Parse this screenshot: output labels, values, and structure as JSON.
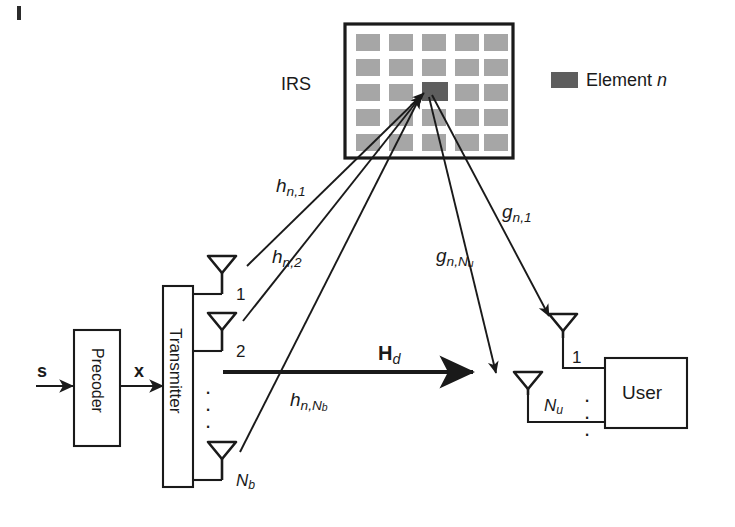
{
  "figure": {
    "width": 735,
    "height": 527,
    "background": "#ffffff",
    "line_color": "#1a1a1a"
  },
  "colors": {
    "element_normal": "#a6a6a6",
    "element_highlight": "#5e5e5e",
    "panel_border": "#1a1a1a",
    "box_border": "#1a1a1a",
    "text": "#1a1a1a",
    "arrow": "#1a1a1a"
  },
  "irs": {
    "label": "IRS",
    "rows": 5,
    "cols": 5,
    "highlight_row": 3,
    "highlight_col": 3
  },
  "legend": {
    "swatch_color": "#5e5e5e",
    "text_main": "Element",
    "text_italic": "n"
  },
  "transmitter": {
    "precoder_label": "Precoder",
    "transmitter_label": "Transmitter",
    "input_signal": "s",
    "precoded_signal": "x",
    "antennas": [
      {
        "label": "1",
        "sub": ""
      },
      {
        "label": "2",
        "sub": ""
      },
      {
        "label": "N",
        "sub": "b"
      }
    ],
    "dots": "⋮"
  },
  "user": {
    "label": "User",
    "antennas": [
      {
        "label": "1",
        "sub": ""
      },
      {
        "label": "N",
        "sub": "u"
      }
    ],
    "dots": "⋮"
  },
  "channels": {
    "tx_to_irs": [
      {
        "base": "h",
        "sub": "n,1"
      },
      {
        "base": "h",
        "sub": "n,2"
      },
      {
        "base": "h",
        "sub": "n,N",
        "sub2": "b"
      }
    ],
    "irs_to_user": [
      {
        "base": "g",
        "sub": "n,1"
      },
      {
        "base": "g",
        "sub": "n,N",
        "sub2": "u"
      }
    ],
    "direct": {
      "base": "H",
      "sub": "d"
    }
  }
}
